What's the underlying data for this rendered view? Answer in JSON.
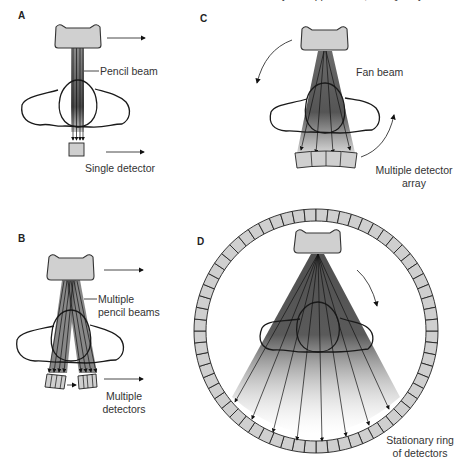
{
  "header_fragment": "... Physics Applications, and Quality Control",
  "panels": {
    "A": {
      "letter": "A",
      "labels": {
        "beam": "Pencil beam",
        "detector": "Single detector"
      }
    },
    "B": {
      "letter": "B",
      "labels": {
        "beam_line1": "Multiple",
        "beam_line2": "pencil beams",
        "detector_line1": "Multiple",
        "detector_line2": "detectors"
      }
    },
    "C": {
      "letter": "C",
      "labels": {
        "beam": "Fan beam",
        "detector_line1": "Multiple detector",
        "detector_line2": "array"
      }
    },
    "D": {
      "letter": "D",
      "labels": {
        "detector_line1": "Stationary ring",
        "detector_line2": "of detectors"
      }
    }
  },
  "colors": {
    "tube_fill": "#d0d0d0",
    "detector_fill": "#cfcfcf",
    "beam_dark": "#3a3a3a",
    "outline": "#1a1a1a"
  }
}
